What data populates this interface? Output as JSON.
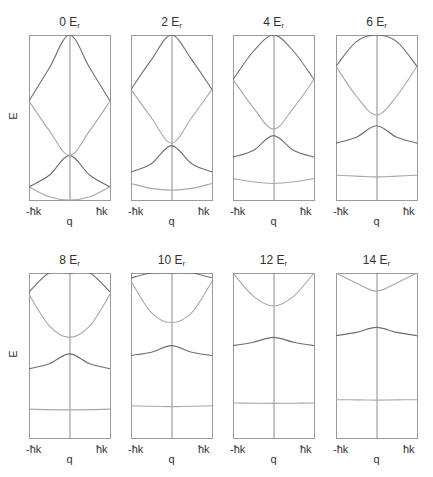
{
  "figure": {
    "ylabel": "E",
    "xlabel": "q",
    "xtick_left": "-ħk",
    "xtick_right": "ħk",
    "frame_color": "#9a9a9a",
    "axis_color": "#8a8a8a",
    "band_colors": [
      "#a8a8a8",
      "#6e6e6e",
      "#a8a8a8",
      "#6e6e6e"
    ]
  },
  "panels": [
    {
      "title_num": "0",
      "title_unit": "E",
      "title_sub": "r",
      "x": 29,
      "y": 35
    },
    {
      "title_num": "2",
      "title_unit": "E",
      "title_sub": "r",
      "x": 131,
      "y": 35
    },
    {
      "title_num": "4",
      "title_unit": "E",
      "title_sub": "r",
      "x": 233,
      "y": 35
    },
    {
      "title_num": "6",
      "title_unit": "E",
      "title_sub": "r",
      "x": 336,
      "y": 35
    },
    {
      "title_num": "8",
      "title_unit": "E",
      "title_sub": "r",
      "x": 29,
      "y": 273
    },
    {
      "title_num": "10",
      "title_unit": "E",
      "title_sub": "r",
      "x": 131,
      "y": 273
    },
    {
      "title_num": "12",
      "title_unit": "E",
      "title_sub": "r",
      "x": 233,
      "y": 273
    },
    {
      "title_num": "14",
      "title_unit": "E",
      "title_sub": "r",
      "x": 336,
      "y": 273
    }
  ],
  "chart_data": {
    "type": "line",
    "xlabel": "q",
    "ylabel": "E",
    "xticks": [
      "-ħk",
      "ħk"
    ],
    "xlim": [
      -1,
      1
    ],
    "ylim_fraction": [
      0,
      1
    ],
    "note": "Band energies given as fraction of panel height (0=bottom, 1=top) at q = -1, -0.5, 0, 0.5, 1 (units of ħk).",
    "q": [
      -1,
      -0.5,
      0,
      0.5,
      1
    ],
    "panels": [
      {
        "depth": "0 Er",
        "bands": [
          {
            "name": "band 1",
            "values": [
              0.08,
              0.02,
              0.0,
              0.02,
              0.08
            ]
          },
          {
            "name": "band 2",
            "values": [
              0.08,
              0.15,
              0.27,
              0.15,
              0.08
            ]
          },
          {
            "name": "band 3",
            "values": [
              0.6,
              0.42,
              0.27,
              0.42,
              0.6
            ]
          },
          {
            "name": "band 4",
            "values": [
              0.6,
              0.8,
              1.0,
              0.8,
              0.6
            ]
          }
        ]
      },
      {
        "depth": "2 Er",
        "bands": [
          {
            "name": "band 1",
            "values": [
              0.1,
              0.07,
              0.06,
              0.07,
              0.1
            ]
          },
          {
            "name": "band 2",
            "values": [
              0.17,
              0.22,
              0.33,
              0.22,
              0.17
            ]
          },
          {
            "name": "band 3",
            "values": [
              0.67,
              0.5,
              0.345,
              0.5,
              0.67
            ]
          },
          {
            "name": "band 4",
            "values": [
              0.67,
              0.85,
              1.0,
              0.85,
              0.67
            ]
          }
        ]
      },
      {
        "depth": "4 Er",
        "bands": [
          {
            "name": "band 1",
            "values": [
              0.13,
              0.11,
              0.1,
              0.11,
              0.13
            ]
          },
          {
            "name": "band 2",
            "values": [
              0.26,
              0.3,
              0.39,
              0.3,
              0.26
            ]
          },
          {
            "name": "band 3",
            "values": [
              0.73,
              0.56,
              0.43,
              0.56,
              0.73
            ]
          },
          {
            "name": "band 4",
            "values": [
              0.73,
              0.9,
              1.0,
              0.9,
              0.73
            ]
          }
        ]
      },
      {
        "depth": "6 Er",
        "bands": [
          {
            "name": "band 1",
            "values": [
              0.15,
              0.145,
              0.14,
              0.145,
              0.15
            ]
          },
          {
            "name": "band 2",
            "values": [
              0.345,
              0.38,
              0.45,
              0.38,
              0.345
            ]
          },
          {
            "name": "band 3",
            "values": [
              0.81,
              0.63,
              0.515,
              0.63,
              0.81
            ]
          },
          {
            "name": "band 4",
            "values": [
              0.81,
              0.96,
              1.0,
              0.96,
              0.81
            ]
          }
        ]
      },
      {
        "depth": "8 Er",
        "bands": [
          {
            "name": "band 1",
            "values": [
              0.175,
              0.172,
              0.17,
              0.172,
              0.175
            ]
          },
          {
            "name": "band 2",
            "values": [
              0.42,
              0.45,
              0.51,
              0.45,
              0.42
            ]
          },
          {
            "name": "band 3",
            "values": [
              0.87,
              0.68,
              0.61,
              0.68,
              0.87
            ]
          },
          {
            "name": "band 4",
            "values": [
              0.885,
              1.0,
              1.0,
              1.0,
              0.885
            ]
          }
        ]
      },
      {
        "depth": "10 Er",
        "bands": [
          {
            "name": "band 1",
            "values": [
              0.195,
              0.192,
              0.19,
              0.192,
              0.195
            ]
          },
          {
            "name": "band 2",
            "values": [
              0.5,
              0.52,
              0.56,
              0.52,
              0.5
            ]
          },
          {
            "name": "band 3",
            "values": [
              0.95,
              0.76,
              0.7,
              0.76,
              0.95
            ]
          },
          {
            "name": "band 4",
            "values": [
              0.97,
              1.0,
              1.0,
              1.0,
              0.97
            ]
          }
        ]
      },
      {
        "depth": "12 Er",
        "bands": [
          {
            "name": "band 1",
            "values": [
              0.212,
              0.211,
              0.21,
              0.211,
              0.212
            ]
          },
          {
            "name": "band 2",
            "values": [
              0.56,
              0.58,
              0.61,
              0.58,
              0.56
            ]
          },
          {
            "name": "band 3",
            "values": [
              1.0,
              0.86,
              0.8,
              0.86,
              1.0
            ]
          }
        ]
      },
      {
        "depth": "14 Er",
        "bands": [
          {
            "name": "band 1",
            "values": [
              0.232,
              0.231,
              0.23,
              0.231,
              0.232
            ]
          },
          {
            "name": "band 2",
            "values": [
              0.62,
              0.64,
              0.67,
              0.64,
              0.62
            ]
          },
          {
            "name": "band 3",
            "values": [
              1.0,
              0.94,
              0.89,
              0.94,
              1.0
            ]
          }
        ]
      }
    ]
  }
}
